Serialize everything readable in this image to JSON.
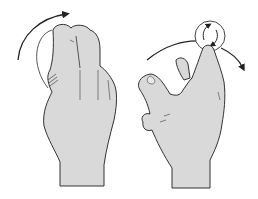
{
  "illustration": {
    "panels": [
      {
        "name": "left-hand-curled-fingers",
        "description": "hand with curled fingers and clockwise arc arrow above"
      },
      {
        "name": "right-hand-pointing-finger",
        "description": "hand with raised index finger tracing a circle, with arc arrow"
      }
    ],
    "colors": {
      "background": "#ffffff",
      "skin_fill": "#d9d9d9",
      "outline": "#333333"
    }
  }
}
